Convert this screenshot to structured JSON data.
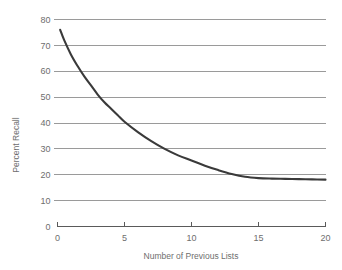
{
  "chart_data": {
    "type": "line",
    "title": "",
    "xlabel": "Number of Previous Lists",
    "ylabel": "Percent Recall",
    "xlim": [
      0,
      20
    ],
    "ylim": [
      0,
      80
    ],
    "grid": true,
    "legend_position": "none",
    "xticks": [
      0,
      5,
      10,
      15,
      20
    ],
    "yticks": [
      0,
      10,
      20,
      30,
      40,
      50,
      60,
      70,
      80
    ],
    "xtick_labels": [
      "0",
      "5",
      "10",
      "15",
      "20"
    ],
    "ytick_labels": [
      "0",
      "10",
      "20",
      "30",
      "40",
      "50",
      "60",
      "70",
      "80"
    ],
    "series": [
      {
        "name": "Percent Recall",
        "color": "#3a3a3a",
        "x": [
          0.2,
          0.5,
          1,
          1.5,
          2,
          2.5,
          3,
          3.5,
          4,
          4.5,
          5,
          6,
          7,
          8,
          9,
          10,
          11,
          12,
          13,
          14,
          15,
          16,
          17,
          18,
          19,
          20
        ],
        "y": [
          76,
          72,
          66.5,
          62,
          58,
          54.5,
          51,
          48,
          45.5,
          43,
          40.5,
          36.5,
          33,
          30,
          27.5,
          25.5,
          23.5,
          21.8,
          20.3,
          19.2,
          18.7,
          18.5,
          18.4,
          18.3,
          18.2,
          18.1
        ]
      }
    ]
  },
  "axes": {
    "y_title": "Percent Recall",
    "x_title": "Number of Previous Lists"
  },
  "colors": {
    "curve": "#3a3a3a",
    "gridline": "#9a9a9a",
    "axis": "#5a5a5a",
    "text": "#6e6e6e",
    "background": "#ffffff"
  }
}
